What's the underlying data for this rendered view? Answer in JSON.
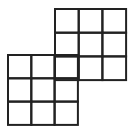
{
  "diagram": {
    "stroke_color": "#222222",
    "background": "#ffffff",
    "grids": [
      {
        "name": "top-right-grid",
        "x": 55,
        "y": 9,
        "rows": 3,
        "cols": 3,
        "cell": 23.7
      },
      {
        "name": "bottom-left-grid",
        "x": 8,
        "y": 55,
        "rows": 3,
        "cols": 3,
        "cell": 23.3
      }
    ]
  }
}
